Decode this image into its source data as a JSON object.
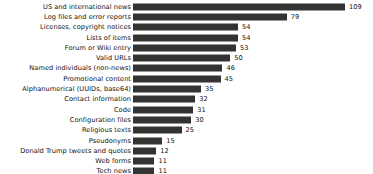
{
  "chart_data": {
    "type": "bar",
    "orientation": "horizontal",
    "title": "",
    "subtitle": "",
    "xlabel": "",
    "ylabel": "",
    "xlim": [
      0,
      109
    ],
    "ylim": null,
    "grid": false,
    "legend": null,
    "legend_position": "none",
    "bar_color": "#333333",
    "text_color": "#111111",
    "background_color": "#ffffff",
    "value_labels_shown": true,
    "axis_lines_shown": false,
    "tick_labels_shown": false,
    "categories": [
      "US and international news",
      "Log files and error reports",
      "Licenses, copyright notices",
      "Lists of items",
      "Forum or Wiki entry",
      "Valid URLs",
      "Named individuals (non-news)",
      "Promotional content",
      "Alphanumerical (UUIDs, base64)",
      "Contact information",
      "Code",
      "Configuration files",
      "Religious texts",
      "Pseudonyms",
      "Donald Trump tweets and quotes",
      "Web forms",
      "Tech news",
      "Lists of numbers"
    ],
    "values": [
      109,
      79,
      54,
      54,
      53,
      50,
      46,
      45,
      35,
      32,
      31,
      30,
      25,
      15,
      12,
      11,
      11,
      10
    ],
    "value_label_texts": [
      "109",
      "79",
      "54",
      "54",
      "53",
      "50",
      "46",
      "45",
      "35",
      "32",
      "31",
      "30",
      "25",
      "15",
      "12",
      "11",
      "11",
      "10"
    ]
  }
}
